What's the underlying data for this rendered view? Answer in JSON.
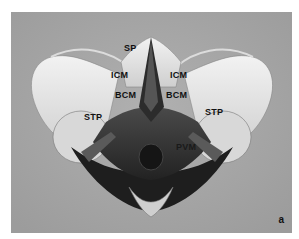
{
  "figure": {
    "panel_letter": "a",
    "labels": {
      "sp": "SP",
      "icm_left": "ICM",
      "icm_right": "ICM",
      "bcm_left": "BCM",
      "bcm_right": "BCM",
      "stp_left": "STP",
      "stp_right": "STP",
      "pvm": "PVM"
    },
    "colors": {
      "background": "#a6a6a6",
      "bone": "#e6e6e6",
      "muscle": "#3a3a3a",
      "border": "#ffffff"
    }
  }
}
